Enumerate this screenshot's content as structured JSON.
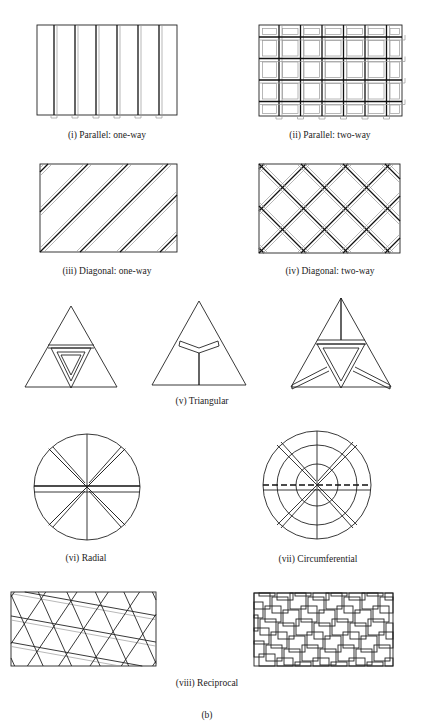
{
  "figure": {
    "panels": [
      {
        "id": "i",
        "caption": "(i) Parallel: one-way"
      },
      {
        "id": "ii",
        "caption": "(ii) Parallel: two-way"
      },
      {
        "id": "iii",
        "caption": "(iii) Diagonal: one-way"
      },
      {
        "id": "iv",
        "caption": "(iv) Diagonal: two-way"
      },
      {
        "id": "v",
        "caption": "(v) Triangular"
      },
      {
        "id": "vi",
        "caption": "(vi) Radial"
      },
      {
        "id": "vii",
        "caption": "(vii) Circumferential"
      },
      {
        "id": "viii",
        "caption": "(viii) Reciprocal"
      }
    ],
    "label": "(b)"
  }
}
